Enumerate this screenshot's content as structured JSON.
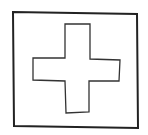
{
  "figure": {
    "stroke_color": "#222222",
    "background": "#ffffff"
  }
}
